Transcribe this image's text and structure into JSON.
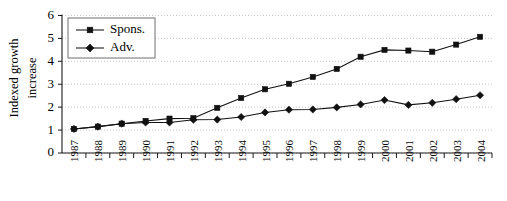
{
  "chart_data": {
    "type": "line",
    "title": "",
    "subtitle": "",
    "xlabel": "",
    "ylabel": "Indexed growth increase",
    "ylabel_line1": "Indexed growth",
    "ylabel_line2": "increase",
    "categories": [
      "1987",
      "1988",
      "1989",
      "1990",
      "1991",
      "1992",
      "1993",
      "1994",
      "1995",
      "1996",
      "1997",
      "1998",
      "1999",
      "2000",
      "2001",
      "2002",
      "2003",
      "2004"
    ],
    "ylim": [
      0,
      6
    ],
    "yticks": [
      0,
      1,
      2,
      3,
      4,
      5,
      6
    ],
    "ytick_labels": [
      "0",
      "1",
      "2",
      "3",
      "4",
      "5",
      "6"
    ],
    "grid": true,
    "grid_axis": "y",
    "legend_position": "top-left",
    "series": [
      {
        "name": "Spons.",
        "marker": "square",
        "color": "#111111",
        "values": [
          1.05,
          1.15,
          1.28,
          1.4,
          1.5,
          1.52,
          1.97,
          2.4,
          2.78,
          3.02,
          3.32,
          3.67,
          4.2,
          4.5,
          4.47,
          4.42,
          4.73,
          5.07
        ]
      },
      {
        "name": "Adv.",
        "marker": "diamond",
        "color": "#111111",
        "values": [
          1.05,
          1.15,
          1.28,
          1.33,
          1.33,
          1.45,
          1.46,
          1.57,
          1.77,
          1.89,
          1.9,
          1.99,
          2.12,
          2.31,
          2.1,
          2.19,
          2.35,
          2.52
        ]
      }
    ]
  },
  "legend": {
    "items": [
      {
        "label": "Spons.",
        "marker": "square"
      },
      {
        "label": "Adv.",
        "marker": "diamond"
      }
    ]
  }
}
